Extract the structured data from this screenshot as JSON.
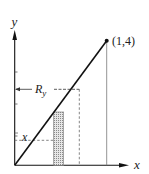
{
  "diagram": {
    "axis_labels": {
      "x": "x",
      "y": "y"
    },
    "point_label": "(1,4)",
    "radius_label": {
      "main": "R",
      "sub": "y"
    },
    "height_label": "x",
    "line": {
      "from": [
        0,
        0
      ],
      "to": [
        1,
        4
      ]
    },
    "colors": {
      "ink": "#111111",
      "guide": "#777777",
      "shade": "#bdbdbd"
    }
  }
}
